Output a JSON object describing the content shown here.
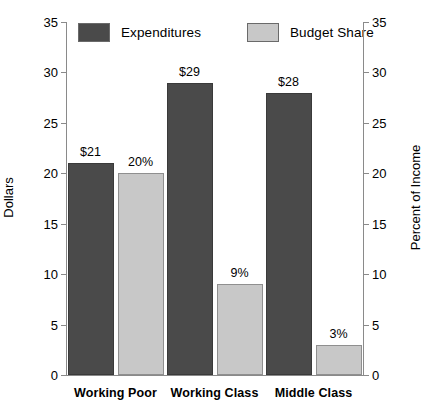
{
  "chart_data": {
    "type": "bar",
    "title": "",
    "subtitle": "",
    "categories": [
      "Working Poor",
      "Working Class",
      "Middle Class"
    ],
    "series": [
      {
        "name": "Expenditures",
        "values": [
          21,
          29,
          28
        ],
        "labels": [
          "$21",
          "$29",
          "$28"
        ],
        "axis": "left",
        "color": "#4a4a4a"
      },
      {
        "name": "Budget Share",
        "values": [
          20,
          9,
          3
        ],
        "labels": [
          "20%",
          "9%",
          "3%"
        ],
        "axis": "right",
        "color": "#c8c8c8"
      }
    ],
    "axes": {
      "left": {
        "label": "Dollars",
        "ticks": [
          0,
          5,
          10,
          15,
          20,
          25,
          30,
          35
        ],
        "tick_labels": [
          "0",
          "5",
          "10",
          "15",
          "20",
          "25",
          "30",
          "35"
        ],
        "min": 0,
        "max": 35
      },
      "right": {
        "label": "Percent of Income",
        "ticks": [
          0,
          5,
          10,
          15,
          20,
          25,
          30,
          35
        ],
        "tick_labels": [
          "0",
          "5",
          "10",
          "15",
          "20",
          "25",
          "30",
          "35"
        ],
        "min": 0,
        "max": 35
      },
      "x": {
        "label": ""
      }
    },
    "legend": {
      "position": "top",
      "entries": [
        {
          "label": "Expenditures",
          "color": "#4a4a4a"
        },
        {
          "label": "Budget Share",
          "color": "#c8c8c8"
        }
      ]
    },
    "grid": false
  }
}
